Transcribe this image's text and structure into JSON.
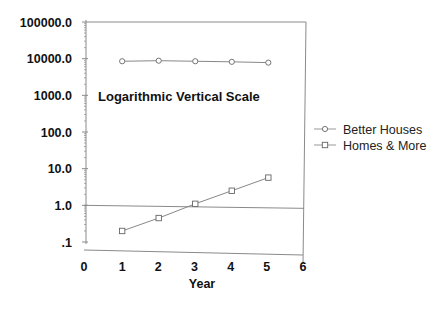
{
  "chart_data": {
    "type": "line",
    "title": "Logarithmic Vertical Scale",
    "xlabel": "Year",
    "ylabel": "",
    "x": [
      1,
      2,
      3,
      4,
      5
    ],
    "xlim": [
      0,
      6
    ],
    "xticks": [
      "0",
      "1",
      "2",
      "3",
      "4",
      "5",
      "6"
    ],
    "yscale": "log",
    "ylim": [
      0.1,
      100000
    ],
    "yticks": [
      "100000.0",
      "10000.0",
      "1000.0",
      "100.0",
      "10.0",
      "1.0",
      ".1"
    ],
    "reference_line": {
      "y": 1.0
    },
    "series": [
      {
        "name": "Better Houses",
        "marker": "circle",
        "values": [
          8500,
          8800,
          8500,
          8200,
          7800
        ]
      },
      {
        "name": "Homes & More",
        "marker": "square",
        "values": [
          0.2,
          0.45,
          1.1,
          2.5,
          5.7
        ]
      }
    ],
    "legend_position": "right",
    "grid": false
  },
  "legend": {
    "items": [
      {
        "label": "Better Houses"
      },
      {
        "label": "Homes & More"
      }
    ]
  }
}
